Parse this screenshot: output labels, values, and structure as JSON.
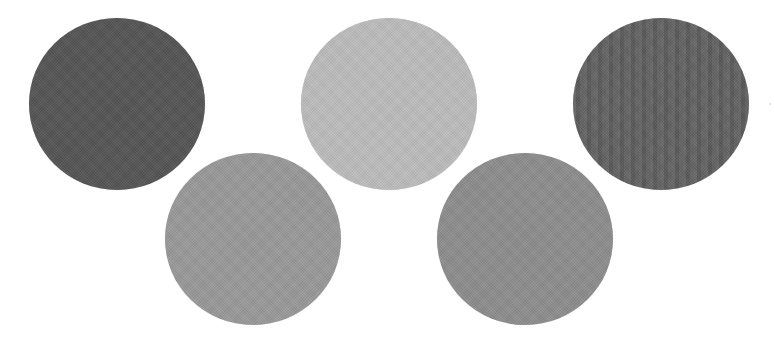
{
  "figure": {
    "background_color": "#ffffff",
    "circles": [
      {
        "id": "circle-1",
        "row": "top",
        "order": 1,
        "color": "#555555",
        "texture": "fine-grain"
      },
      {
        "id": "circle-2",
        "row": "bottom",
        "order": 1,
        "color": "#9a9a9a",
        "texture": "fine-grain"
      },
      {
        "id": "circle-3",
        "row": "top",
        "order": 2,
        "color": "#bdbdbd",
        "texture": "fine-grain"
      },
      {
        "id": "circle-4",
        "row": "bottom",
        "order": 2,
        "color": "#8e8e8e",
        "texture": "fine-grain"
      },
      {
        "id": "circle-5",
        "row": "top",
        "order": 3,
        "color": "#5f5f5f",
        "texture": "vertical-stripes"
      }
    ]
  }
}
